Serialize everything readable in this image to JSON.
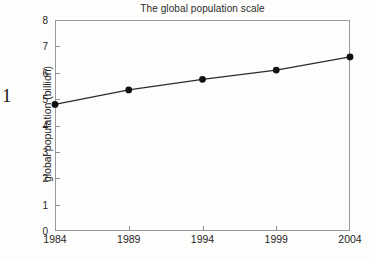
{
  "page": {
    "artifact_number": "1"
  },
  "chart_data": {
    "type": "line",
    "title": "The global population scale",
    "xlabel": "",
    "ylabel": "global population (billion)",
    "categories": [
      "1984",
      "1989",
      "1994",
      "1999",
      "2004"
    ],
    "x": [
      1984,
      1989,
      1994,
      1999,
      2004
    ],
    "values": [
      4.8,
      5.35,
      5.75,
      6.1,
      6.6
    ],
    "series": [
      {
        "name": "global population",
        "values": [
          4.8,
          5.35,
          5.75,
          6.1,
          6.6
        ]
      }
    ],
    "ylim": [
      0,
      8
    ],
    "xlim": [
      1984,
      2004
    ],
    "y_ticks": [
      "0",
      "1",
      "2",
      "3",
      "4",
      "5",
      "6",
      "7",
      "8"
    ],
    "x_ticks": [
      "1984",
      "1989",
      "1994",
      "1999",
      "2004"
    ],
    "grid": false,
    "legend": false,
    "legend_position": "none",
    "marker": "filled-circle",
    "line_color": "#2b2b2b",
    "marker_color": "#111111",
    "frame_color": "#9a9a9a",
    "background_color": "#fdfdfb"
  }
}
